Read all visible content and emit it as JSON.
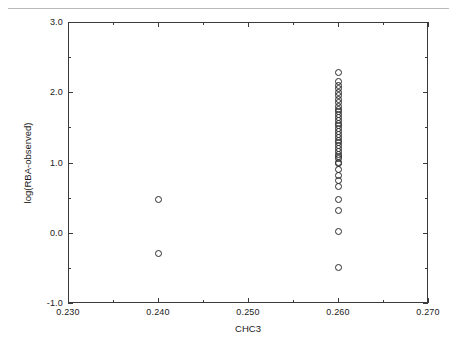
{
  "chart_data": {
    "type": "scatter",
    "title": "",
    "xlabel": "CHC3",
    "ylabel": "log(RBA-observed)",
    "xlim": [
      0.23,
      0.27
    ],
    "ylim": [
      -1.0,
      3.0
    ],
    "grid": false,
    "legend": null,
    "marker": "open-circle",
    "marker_color": "#2b2b2b",
    "xticks": [
      0.23,
      0.24,
      0.25,
      0.26,
      0.27
    ],
    "xticklabels": [
      "0.230",
      "0.240",
      "0.250",
      "0.260",
      "0.270"
    ],
    "xminorticks": [
      0.235,
      0.245,
      0.255,
      0.265
    ],
    "yticks": [
      -1.0,
      0.0,
      1.0,
      2.0,
      3.0
    ],
    "yticklabels": [
      "-1.0",
      "0.0",
      "1.0",
      "2.0",
      "3.0"
    ],
    "yminorticks": [
      -0.5,
      0.5,
      1.5,
      2.5
    ],
    "series": [
      {
        "name": "observations",
        "x": [
          0.24,
          0.24,
          0.26,
          0.26,
          0.26,
          0.26,
          0.26,
          0.26,
          0.26,
          0.26,
          0.26,
          0.26,
          0.26,
          0.26,
          0.26,
          0.26,
          0.26,
          0.26,
          0.26,
          0.26,
          0.26,
          0.26,
          0.26,
          0.26,
          0.26,
          0.26,
          0.26,
          0.26,
          0.26,
          0.26,
          0.26,
          0.26,
          0.26,
          0.26,
          0.26,
          0.26,
          0.26,
          0.26,
          0.26,
          0.26
        ],
        "y": [
          0.48,
          -0.3,
          2.28,
          2.15,
          2.1,
          2.05,
          2.0,
          1.95,
          1.9,
          1.85,
          1.8,
          1.76,
          1.72,
          1.68,
          1.64,
          1.6,
          1.56,
          1.52,
          1.48,
          1.44,
          1.4,
          1.36,
          1.32,
          1.28,
          1.24,
          1.2,
          1.16,
          1.12,
          1.05,
          0.98,
          0.9,
          0.82,
          0.74,
          0.66,
          0.48,
          0.31,
          0.02,
          -0.5,
          1.08,
          1.0
        ]
      }
    ]
  }
}
